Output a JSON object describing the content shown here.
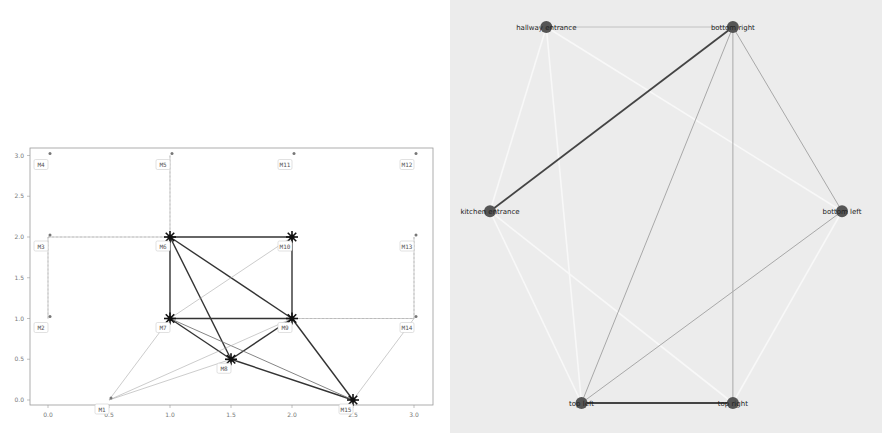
{
  "left_chart": {
    "title": "",
    "x_ticks": [
      "0.0",
      "0.5",
      "1.0",
      "1.5",
      "2.0",
      "2.5",
      "3.0"
    ],
    "y_ticks": [
      "0.0",
      "0.5",
      "1.0",
      "1.5",
      "2.0",
      "2.5",
      "3.0"
    ],
    "xlim": [
      -0.15,
      3.15
    ],
    "ylim": [
      -0.15,
      3.2
    ]
  },
  "right_graph": {
    "background": "#ececec",
    "node_color": "#555555"
  },
  "chart_data": [
    {
      "type": "network",
      "title": "",
      "xlabel": "",
      "ylabel": "",
      "xlim": [
        -0.15,
        3.15
      ],
      "ylim": [
        -0.15,
        3.2
      ],
      "grid": false,
      "nodes": [
        {
          "id": "M1",
          "x": 0.5,
          "y": 0.0
        },
        {
          "id": "M2",
          "x": 0.0,
          "y": 1.0
        },
        {
          "id": "M3",
          "x": 0.0,
          "y": 2.0
        },
        {
          "id": "M4",
          "x": 0.0,
          "y": 3.0
        },
        {
          "id": "M5",
          "x": 1.0,
          "y": 3.0
        },
        {
          "id": "M6",
          "x": 1.0,
          "y": 2.0
        },
        {
          "id": "M7",
          "x": 1.0,
          "y": 1.0
        },
        {
          "id": "M8",
          "x": 1.5,
          "y": 0.5
        },
        {
          "id": "M9",
          "x": 2.0,
          "y": 1.0
        },
        {
          "id": "M10",
          "x": 2.0,
          "y": 2.0
        },
        {
          "id": "M11",
          "x": 2.0,
          "y": 3.0
        },
        {
          "id": "M12",
          "x": 3.0,
          "y": 3.0
        },
        {
          "id": "M13",
          "x": 3.0,
          "y": 2.0
        },
        {
          "id": "M14",
          "x": 3.0,
          "y": 1.0
        },
        {
          "id": "M15",
          "x": 2.5,
          "y": 0.0
        }
      ],
      "edges": [
        {
          "from": "M6",
          "to": "M10",
          "weight": "strong"
        },
        {
          "from": "M6",
          "to": "M7",
          "weight": "strong"
        },
        {
          "from": "M10",
          "to": "M9",
          "weight": "strong"
        },
        {
          "from": "M7",
          "to": "M9",
          "weight": "strong"
        },
        {
          "from": "M6",
          "to": "M9",
          "weight": "strong"
        },
        {
          "from": "M6",
          "to": "M8",
          "weight": "strong"
        },
        {
          "from": "M7",
          "to": "M8",
          "weight": "strong"
        },
        {
          "from": "M8",
          "to": "M9",
          "weight": "strong"
        },
        {
          "from": "M8",
          "to": "M15",
          "weight": "strong"
        },
        {
          "from": "M9",
          "to": "M15",
          "weight": "strong"
        },
        {
          "from": "M7",
          "to": "M15",
          "weight": "medium"
        },
        {
          "from": "M7",
          "to": "M10",
          "weight": "weak"
        },
        {
          "from": "M1",
          "to": "M7",
          "weight": "weak"
        },
        {
          "from": "M1",
          "to": "M9",
          "weight": "weak"
        },
        {
          "from": "M1",
          "to": "M8",
          "weight": "weak"
        },
        {
          "from": "M14",
          "to": "M15",
          "weight": "weak"
        },
        {
          "from": "M13",
          "to": "M14",
          "weight": "weak"
        },
        {
          "from": "M2",
          "to": "M3",
          "weight": "weak"
        },
        {
          "from": "M3",
          "to": "M6",
          "weight": "weak"
        },
        {
          "from": "M5",
          "to": "M6",
          "weight": "weak"
        },
        {
          "from": "M9",
          "to": "M14",
          "weight": "weak"
        }
      ]
    },
    {
      "type": "network",
      "title": "",
      "nodes": [
        {
          "id": "hallway entrance",
          "x": 0.16,
          "y": 0.0
        },
        {
          "id": "bottom right",
          "x": 0.69,
          "y": 0.0
        },
        {
          "id": "kitchen entrance",
          "x": 0.0,
          "y": 0.49
        },
        {
          "id": "bottom left",
          "x": 1.0,
          "y": 0.49
        },
        {
          "id": "top left",
          "x": 0.26,
          "y": 1.0
        },
        {
          "id": "top right",
          "x": 0.69,
          "y": 1.0
        }
      ],
      "edges": [
        {
          "from": "hallway entrance",
          "to": "bottom right",
          "weight": "weak"
        },
        {
          "from": "kitchen entrance",
          "to": "bottom right",
          "weight": "strong"
        },
        {
          "from": "top left",
          "to": "top right",
          "weight": "strong"
        },
        {
          "from": "bottom right",
          "to": "top left",
          "weight": "medium"
        },
        {
          "from": "bottom right",
          "to": "top right",
          "weight": "medium"
        },
        {
          "from": "bottom right",
          "to": "bottom left",
          "weight": "medium"
        },
        {
          "from": "bottom left",
          "to": "top left",
          "weight": "medium"
        },
        {
          "from": "hallway entrance",
          "to": "bottom left",
          "weight": "faint"
        },
        {
          "from": "hallway entrance",
          "to": "top left",
          "weight": "faint"
        },
        {
          "from": "kitchen entrance",
          "to": "top right",
          "weight": "faint"
        },
        {
          "from": "kitchen entrance",
          "to": "top left",
          "weight": "faint"
        },
        {
          "from": "bottom left",
          "to": "top right",
          "weight": "faint"
        },
        {
          "from": "hallway entrance",
          "to": "kitchen entrance",
          "weight": "faint"
        }
      ]
    }
  ]
}
